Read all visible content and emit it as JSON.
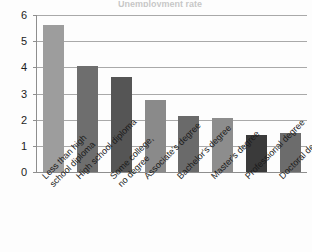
{
  "chart_data": {
    "type": "bar",
    "title": "",
    "xlabel": "",
    "ylabel": "",
    "ylim": [
      0,
      6
    ],
    "grid": true,
    "legend": "none",
    "yticks": [
      "0",
      "1",
      "2",
      "3",
      "4",
      "5",
      "6"
    ],
    "categories": [
      "Less than high school diploma",
      "High school diploma",
      "Some college, no degree",
      "Associate's degree",
      "Bachelor's degree",
      "Master's degree",
      "Professional degree",
      "Doctoral degree"
    ],
    "category_lines": [
      [
        "Less than high",
        "school diploma"
      ],
      [
        "High school diploma",
        ""
      ],
      [
        "Some college,",
        "no degree"
      ],
      [
        "Associate's degree",
        ""
      ],
      [
        "Bachelor's degree",
        ""
      ],
      [
        "Master's degree",
        ""
      ],
      [
        "Professional degree",
        ""
      ],
      [
        "Doctoral degree",
        ""
      ]
    ],
    "values": [
      5.6,
      4.05,
      3.65,
      2.75,
      2.15,
      2.05,
      1.4,
      1.5
    ],
    "bar_colors": [
      "#9d9d9d",
      "#6e6e6e",
      "#555555",
      "#8a8a8a",
      "#6a6a6a",
      "#8d8d8d",
      "#3a3a3a",
      "#6c6c6c"
    ]
  },
  "axis": {
    "grid_color": "#a9a9a9",
    "axis_color": "#8e8e8e"
  },
  "title_sliver": "Unemployment rate"
}
